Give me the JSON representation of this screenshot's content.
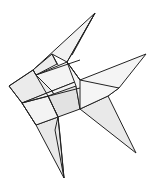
{
  "figure": {
    "subject": "origami fish line drawing",
    "colors": {
      "background": "#ffffff",
      "stroke": "#222222",
      "fill_light": "#f4f4f4",
      "fill_mid": "#e6e6e6",
      "fill_dark": "#d9d9d9"
    }
  }
}
